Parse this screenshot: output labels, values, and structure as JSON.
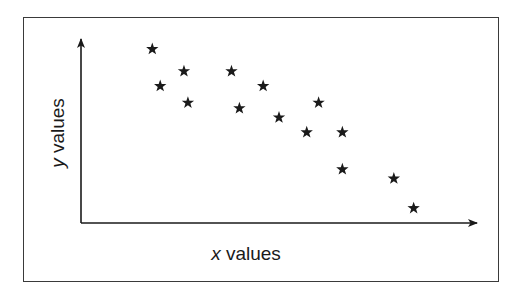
{
  "chart_data": {
    "type": "scatter",
    "title": "",
    "xlabel": "x values",
    "ylabel": "y values",
    "xlabel_var": "x",
    "xlabel_rest": " values",
    "ylabel_var": "y",
    "ylabel_rest": " values",
    "marker": "star",
    "marker_color": "#1a1a1a",
    "grid": false,
    "ticks": false,
    "legend": null,
    "xlim": [
      0,
      10
    ],
    "ylim": [
      0,
      10
    ],
    "points": [
      {
        "x": 1.8,
        "y": 9.4
      },
      {
        "x": 2.0,
        "y": 7.4
      },
      {
        "x": 2.6,
        "y": 8.2
      },
      {
        "x": 2.7,
        "y": 6.5
      },
      {
        "x": 3.8,
        "y": 8.2
      },
      {
        "x": 4.0,
        "y": 6.2
      },
      {
        "x": 4.6,
        "y": 7.4
      },
      {
        "x": 5.0,
        "y": 5.7
      },
      {
        "x": 6.0,
        "y": 6.5
      },
      {
        "x": 5.7,
        "y": 4.9
      },
      {
        "x": 6.6,
        "y": 4.9
      },
      {
        "x": 6.6,
        "y": 2.9
      },
      {
        "x": 7.9,
        "y": 2.4
      },
      {
        "x": 8.4,
        "y": 0.8
      }
    ],
    "trend": "negative correlation"
  }
}
